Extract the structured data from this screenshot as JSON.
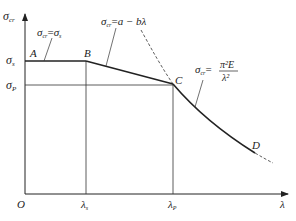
{
  "diagram": {
    "axes": {
      "y_label": "σ",
      "y_label_sub": "cr",
      "x_label": "λ",
      "origin": "O"
    },
    "y_ticks": [
      {
        "label": "σ",
        "sub": "s",
        "y": 61
      },
      {
        "label": "σ",
        "sub": "P",
        "y": 85
      }
    ],
    "x_ticks": [
      {
        "label": "λ",
        "sub": "s",
        "x": 86
      },
      {
        "label": "λ",
        "sub": "P",
        "x": 173
      }
    ],
    "points": {
      "A": "A",
      "B": "B",
      "C": "C",
      "D": "D"
    },
    "formulas": {
      "yield": {
        "lhs": "σ",
        "lhs_sub": "cr",
        "eq": "=",
        "rhs": "σ",
        "rhs_sub": "s"
      },
      "linear": {
        "lhs": "σ",
        "lhs_sub": "cr",
        "eq": "=",
        "rhs": "a − bλ"
      },
      "euler": {
        "lhs": "σ",
        "lhs_sub": "cr",
        "eq": "=",
        "num": "π²E",
        "den": "λ²"
      }
    },
    "colors": {
      "line": "#222222",
      "grid": "#333333"
    }
  }
}
